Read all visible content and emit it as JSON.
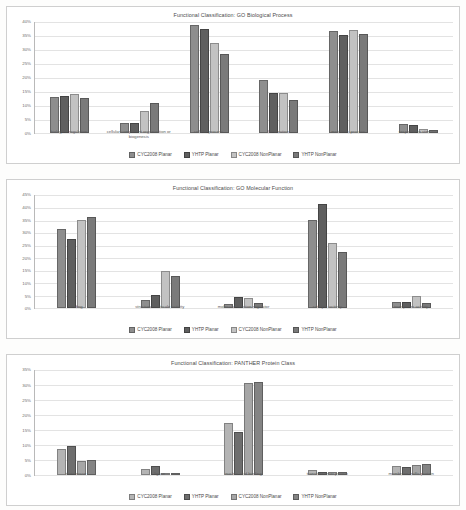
{
  "series_colors": {
    "CYC2008 Planar": "#8e8e8e",
    "YHTP Planar": "#5f5f5f",
    "CYC2008 NonPlanar": "#c2c2c2",
    "YHTP NonPlanar": "#7a7a7a"
  },
  "legend_labels": [
    "CYC2008 Planar",
    "YHTP Planar",
    "CYC2008 NonPlanar",
    "YHTP NonPlanar"
  ],
  "charts": [
    {
      "title": "Functional Classification: GO Biological Process",
      "yticks": [
        "40%",
        "35%",
        "30%",
        "25%",
        "20%",
        "15%",
        "10%",
        "5%",
        "0%"
      ],
      "categories": [
        "biological regulation",
        "cellular component organization or biogenesis",
        "cellular process",
        "localization",
        "metabolic process",
        "response to stimulus"
      ]
    },
    {
      "title": "Functional Classification: GO Molecular Function",
      "yticks": [
        "45%",
        "40%",
        "35%",
        "30%",
        "25%",
        "20%",
        "15%",
        "10%",
        "5%",
        "0%"
      ],
      "categories": [
        "binding",
        "structural molecule activity",
        "molecular function regulator",
        "catalytic activity",
        "transporter activity"
      ]
    },
    {
      "title": "Functional Classification: PANTHER Protein Class",
      "yticks": [
        "35%",
        "30%",
        "25%",
        "20%",
        "15%",
        "10%",
        "5%",
        "0%"
      ],
      "categories": [
        "transferase",
        "ligase",
        "nucleic acid binding",
        "transfer/carrier protein",
        "membrane traffic protein"
      ]
    }
  ],
  "chart_data": [
    {
      "type": "bar",
      "title": "Functional Classification: GO Biological Process",
      "xlabel": "",
      "ylabel": "",
      "ylim": [
        0,
        40
      ],
      "yticks": [
        0,
        5,
        10,
        15,
        20,
        25,
        30,
        35,
        40
      ],
      "ytick_labels": [
        "0%",
        "5%",
        "10%",
        "15%",
        "20%",
        "25%",
        "30%",
        "35%",
        "40%"
      ],
      "grid": true,
      "legend_position": "bottom",
      "categories": [
        "biological regulation",
        "cellular component organization or biogenesis",
        "cellular process",
        "localization",
        "metabolic process",
        "response to stimulus"
      ],
      "series": [
        {
          "name": "CYC2008 Planar",
          "values": [
            13.3,
            3.6,
            39.0,
            19.2,
            37.0,
            3.4
          ]
        },
        {
          "name": "YHTP Planar",
          "values": [
            13.6,
            3.9,
            37.5,
            14.4,
            35.6,
            3.1
          ]
        },
        {
          "name": "CYC2008 NonPlanar",
          "values": [
            14.3,
            7.9,
            32.7,
            14.6,
            37.4,
            1.6
          ]
        },
        {
          "name": "YHTP NonPlanar",
          "values": [
            12.8,
            10.9,
            28.8,
            12.1,
            35.9,
            1.3
          ]
        }
      ]
    },
    {
      "type": "bar",
      "title": "Functional Classification: GO Molecular Function",
      "xlabel": "",
      "ylabel": "",
      "ylim": [
        0,
        45
      ],
      "yticks": [
        0,
        5,
        10,
        15,
        20,
        25,
        30,
        35,
        40,
        45
      ],
      "ytick_labels": [
        "0%",
        "5%",
        "10%",
        "15%",
        "20%",
        "25%",
        "30%",
        "35%",
        "40%",
        "45%"
      ],
      "grid": true,
      "legend_position": "bottom",
      "categories": [
        "binding",
        "structural molecule activity",
        "molecular function regulator",
        "catalytic activity",
        "transporter activity"
      ],
      "series": [
        {
          "name": "CYC2008 Planar",
          "values": [
            31.8,
            3.5,
            1.9,
            35.3,
            2.5
          ]
        },
        {
          "name": "YHTP Planar",
          "values": [
            27.7,
            5.2,
            4.6,
            41.6,
            2.7
          ]
        },
        {
          "name": "CYC2008 NonPlanar",
          "values": [
            35.4,
            14.8,
            4.1,
            25.9,
            4.8
          ]
        },
        {
          "name": "YHTP NonPlanar",
          "values": [
            36.4,
            13.0,
            2.0,
            22.6,
            2.1
          ]
        }
      ]
    },
    {
      "type": "bar",
      "title": "Functional Classification: PANTHER Protein Class",
      "xlabel": "",
      "ylabel": "",
      "ylim": [
        0,
        35
      ],
      "yticks": [
        0,
        5,
        10,
        15,
        20,
        25,
        30,
        35
      ],
      "ytick_labels": [
        "0%",
        "5%",
        "10%",
        "15%",
        "20%",
        "25%",
        "30%",
        "35%"
      ],
      "grid": true,
      "legend_position": "bottom",
      "categories": [
        "transferase",
        "ligase",
        "nucleic acid binding",
        "transfer/carrier protein",
        "membrane traffic protein"
      ],
      "series": [
        {
          "name": "CYC2008 Planar",
          "values": [
            8.9,
            2.2,
            17.5,
            1.7,
            3.0
          ]
        },
        {
          "name": "YHTP Planar",
          "values": [
            9.7,
            3.0,
            14.5,
            1.3,
            2.8
          ]
        },
        {
          "name": "CYC2008 NonPlanar",
          "values": [
            4.8,
            0.8,
            30.7,
            1.3,
            3.6
          ]
        },
        {
          "name": "YHTP NonPlanar",
          "values": [
            5.2,
            0.7,
            31.1,
            1.3,
            3.7
          ]
        }
      ]
    }
  ]
}
